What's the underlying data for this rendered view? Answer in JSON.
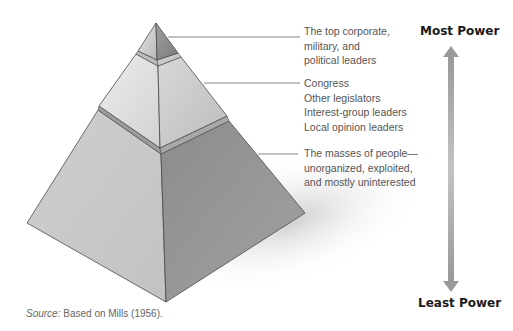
{
  "figure": {
    "type": "power-elite-pyramid",
    "tiers": [
      {
        "id": "top",
        "lines": [
          "The top corporate,",
          "military, and",
          "political leaders"
        ]
      },
      {
        "id": "middle",
        "lines": [
          "Congress",
          "Other legislators",
          "Interest-group leaders",
          "Local opinion leaders"
        ]
      },
      {
        "id": "bottom",
        "lines": [
          "The masses of people—",
          "unorganized, exploited,",
          "and mostly uninterested"
        ]
      }
    ],
    "scale": {
      "top_label": "Most Power",
      "bottom_label": "Least Power",
      "arrow": "double-arrow-vertical"
    },
    "source": {
      "prefix": "Source:",
      "text": " Based on Mills (1956)."
    },
    "colors": {
      "left_face_light": "#d6d6d6",
      "right_face_mid": "#bdbdbd",
      "right_face_dark": "#8f8f8f",
      "band": "#9a9a9a",
      "outline": "#4a4a4a",
      "arrow": "#a8a8a8",
      "label_text": "#555555",
      "power_text": "#1a1a1a"
    }
  }
}
